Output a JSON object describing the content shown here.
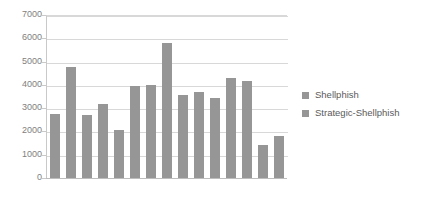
{
  "chart_data": {
    "type": "bar",
    "title": "",
    "subtitle": "",
    "xlabel": "",
    "ylabel": "",
    "ylim": [
      0,
      7000
    ],
    "ytick_values": [
      0,
      1000,
      2000,
      3000,
      4000,
      5000,
      6000,
      7000
    ],
    "ytick_labels": [
      "0",
      "1000",
      "2000",
      "3000",
      "4000",
      "5000",
      "6000",
      "7000"
    ],
    "xtick_labels": [],
    "grid": true,
    "legend_position": "right",
    "bar_color": "#969696",
    "gridline_color": "#d8d8d8",
    "axis_color": "#c9c9c9",
    "tick_label_color": "#808080",
    "legend_label_color": "#5a5a5a",
    "categories": [
      "1",
      "2",
      "3",
      "4",
      "5",
      "6"
    ],
    "series": [
      {
        "name": "Shellphish",
        "values": [
          2750,
          2700,
          2050,
          4000,
          3550,
          3450
        ]
      },
      {
        "name": "Strategic-Shellphish",
        "values": [
          4750,
          3200,
          3950,
          5800,
          3700,
          4300
        ]
      }
    ],
    "bars_in_order": [
      {
        "series": "Shellphish",
        "category": "1",
        "value": 2750
      },
      {
        "series": "Strategic-Shellphish",
        "category": "1",
        "value": 4750
      },
      {
        "series": "Shellphish",
        "category": "2",
        "value": 2700
      },
      {
        "series": "Strategic-Shellphish",
        "category": "2",
        "value": 3200
      },
      {
        "series": "Shellphish",
        "category": "3",
        "value": 2050
      },
      {
        "series": "Strategic-Shellphish",
        "category": "3",
        "value": 3950
      },
      {
        "series": "Shellphish",
        "category": "4",
        "value": 4000
      },
      {
        "series": "Strategic-Shellphish",
        "category": "4",
        "value": 5800
      },
      {
        "series": "Shellphish",
        "category": "5",
        "value": 3550
      },
      {
        "series": "Strategic-Shellphish",
        "category": "5",
        "value": 3700
      },
      {
        "series": "Shellphish",
        "category": "6",
        "value": 3450
      },
      {
        "series": "Strategic-Shellphish",
        "category": "6",
        "value": 4300
      },
      {
        "series": "Shellphish",
        "category": "7",
        "value": 4150
      },
      {
        "series": "Strategic-Shellphish",
        "category": "7",
        "value": 1400
      },
      {
        "series": "Extra",
        "category": "7",
        "value": 1800
      }
    ]
  },
  "legend": {
    "items": [
      {
        "label": "Shellphish",
        "color": "#969696"
      },
      {
        "label": "Strategic-Shellphish",
        "color": "#969696"
      }
    ]
  }
}
